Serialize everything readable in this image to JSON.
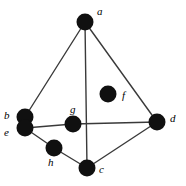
{
  "figure": {
    "type": "graph-diagram",
    "title": "",
    "background_color": "#ffffff",
    "width": 186,
    "height": 186
  },
  "style": {
    "node_fill": "#101010",
    "node_radius": 8.5,
    "edge_color": "#3a3a3a",
    "edge_width": 1.4,
    "label_color": "#000000",
    "label_font_size": 11
  },
  "graph": {
    "nodes": [
      {
        "id": "a",
        "label": "a",
        "cx": 85,
        "cy": 22,
        "r": 8.5,
        "label_x": 97,
        "label_y": 6
      },
      {
        "id": "b",
        "label": "b",
        "cx": 25,
        "cy": 117,
        "r": 8.5,
        "label_x": 4,
        "label_y": 110
      },
      {
        "id": "c",
        "label": "c",
        "cx": 87,
        "cy": 168,
        "r": 8.5,
        "label_x": 99,
        "label_y": 164
      },
      {
        "id": "d",
        "label": "d",
        "cx": 157,
        "cy": 122,
        "r": 8.5,
        "label_x": 170,
        "label_y": 113
      },
      {
        "id": "e",
        "label": "e",
        "cx": 25,
        "cy": 128,
        "r": 8.5,
        "label_x": 4,
        "label_y": 127
      },
      {
        "id": "f",
        "label": "f",
        "cx": 108,
        "cy": 94,
        "r": 8.5,
        "label_x": 122,
        "label_y": 90
      },
      {
        "id": "g",
        "label": "g",
        "cx": 73,
        "cy": 124,
        "r": 8.5,
        "label_x": 70,
        "label_y": 104
      },
      {
        "id": "h",
        "label": "h",
        "cx": 54,
        "cy": 148,
        "r": 8.5,
        "label_x": 48,
        "label_y": 157
      }
    ],
    "edges": [
      {
        "id": "a-b",
        "from": "a",
        "to": "b"
      },
      {
        "id": "a-c",
        "from": "a",
        "to": "c"
      },
      {
        "id": "a-d",
        "from": "a",
        "to": "d"
      },
      {
        "id": "e-g",
        "from": "e",
        "to": "g"
      },
      {
        "id": "g-d",
        "from": "g",
        "to": "d"
      },
      {
        "id": "e-h",
        "from": "e",
        "to": "h"
      },
      {
        "id": "h-c",
        "from": "h",
        "to": "c"
      },
      {
        "id": "c-d",
        "from": "c",
        "to": "d"
      }
    ]
  }
}
